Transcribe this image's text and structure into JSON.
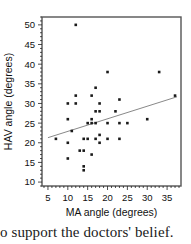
{
  "figure": {
    "caption_text": "o support the doctors' belief."
  },
  "chart_data": {
    "type": "scatter",
    "title": "",
    "xlabel": "MA angle (degrees)",
    "ylabel": "HAV angle (degrees)",
    "xlim": [
      3.5,
      38.5
    ],
    "ylim": [
      9,
      52
    ],
    "xticks": [
      5,
      10,
      15,
      20,
      25,
      30,
      35
    ],
    "yticks": [
      10,
      15,
      20,
      25,
      30,
      35,
      40,
      45,
      50
    ],
    "x_minor_tick_step": 1,
    "y_minor_tick_step": 1,
    "grid": false,
    "legend": null,
    "marker": "square",
    "marker_color": "#1a1a1a",
    "marker_size": 2.6,
    "frame": true,
    "frame_color": "#555555",
    "points": [
      {
        "x": 7,
        "y": 21
      },
      {
        "x": 10,
        "y": 30
      },
      {
        "x": 10,
        "y": 26
      },
      {
        "x": 10,
        "y": 20
      },
      {
        "x": 10,
        "y": 16
      },
      {
        "x": 11,
        "y": 23
      },
      {
        "x": 12,
        "y": 50
      },
      {
        "x": 12,
        "y": 32
      },
      {
        "x": 12,
        "y": 30
      },
      {
        "x": 13,
        "y": 18
      },
      {
        "x": 14,
        "y": 21
      },
      {
        "x": 14,
        "y": 18
      },
      {
        "x": 14,
        "y": 14
      },
      {
        "x": 14,
        "y": 13
      },
      {
        "x": 15,
        "y": 21
      },
      {
        "x": 15,
        "y": 25
      },
      {
        "x": 16,
        "y": 32
      },
      {
        "x": 16,
        "y": 26
      },
      {
        "x": 16,
        "y": 25
      },
      {
        "x": 16,
        "y": 17
      },
      {
        "x": 17,
        "y": 34
      },
      {
        "x": 17,
        "y": 28
      },
      {
        "x": 17,
        "y": 25
      },
      {
        "x": 17,
        "y": 21
      },
      {
        "x": 18,
        "y": 30
      },
      {
        "x": 18,
        "y": 28
      },
      {
        "x": 18,
        "y": 22
      },
      {
        "x": 18,
        "y": 20
      },
      {
        "x": 20,
        "y": 38
      },
      {
        "x": 20,
        "y": 25
      },
      {
        "x": 20,
        "y": 21
      },
      {
        "x": 22,
        "y": 28
      },
      {
        "x": 23,
        "y": 31
      },
      {
        "x": 23,
        "y": 25
      },
      {
        "x": 23,
        "y": 21
      },
      {
        "x": 25,
        "y": 25
      },
      {
        "x": 30,
        "y": 26
      },
      {
        "x": 33,
        "y": 38
      },
      {
        "x": 37,
        "y": 32
      }
    ],
    "trend_line": {
      "type": "linear",
      "x_start": 5,
      "y_start": 21.3,
      "x_end": 37.5,
      "y_end": 31.7,
      "color": "#7a7a7a"
    }
  }
}
